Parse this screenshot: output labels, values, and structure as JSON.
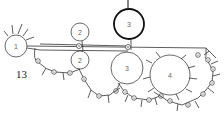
{
  "figure": {
    "label": "13",
    "nodes": [
      {
        "id": "n1",
        "label": "1"
      },
      {
        "id": "n2a",
        "label": "2"
      },
      {
        "id": "n2b",
        "label": "2"
      },
      {
        "id": "n3a",
        "label": "3"
      },
      {
        "id": "n3b",
        "label": "3"
      },
      {
        "id": "n4",
        "label": "4"
      }
    ]
  },
  "colors": {
    "stroke": "#333333",
    "background": "#ffffff"
  }
}
